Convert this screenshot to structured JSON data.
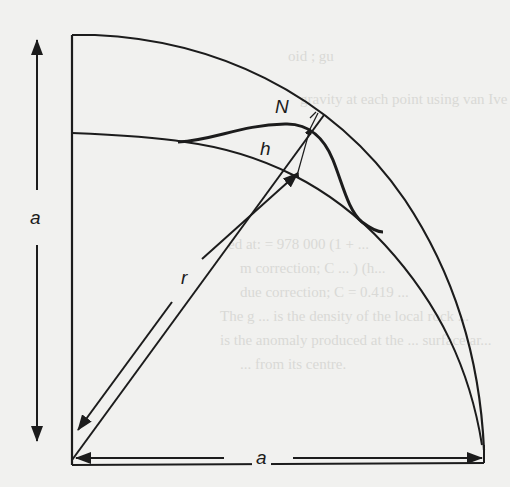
{
  "figure": {
    "labels": {
      "a_vertical": "a",
      "a_horizontal": "a",
      "radius": "r",
      "ellipsoid_height": "h",
      "geoid_undulation": "N"
    },
    "elements": [
      "outer-arc (topographic / terrain surface)",
      "ellipsoid-arc (reference ellipsoid)",
      "geoid-curve",
      "radius-vector-r",
      "undulation-N",
      "height-h"
    ],
    "colors": {
      "ink": "#1c1c1c",
      "paper": "#f1f1ef",
      "bleed_text": "#d9d9d6"
    }
  },
  "background_bleed_text": [
    "oid ; gu",
    "gravity at each point using van Ive",
    "ed at:       = 978 000 (1 + ...",
    "m correction;  C  ... ) (h...",
    "due correction;  C  = 0.419 ...",
    "The g         ...  is the density of the local rock ...",
    "is the anomaly produced at the ... surface ar...",
    "... from its centre."
  ]
}
